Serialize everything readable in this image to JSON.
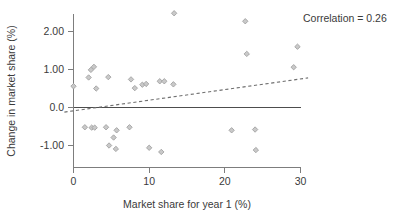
{
  "chart_data": {
    "type": "scatter",
    "title": "",
    "xlabel": "Market share for year 1 (%)",
    "ylabel": "Change in market share (%)",
    "xlim": [
      -1.5,
      31.5
    ],
    "ylim": [
      -1.55,
      2.75
    ],
    "xticks": [
      0,
      10,
      20,
      30
    ],
    "xtick_labels": [
      "0",
      "10",
      "20",
      "30"
    ],
    "yticks": [
      -1.0,
      0.0,
      1.0,
      2.0
    ],
    "ytick_labels": [
      "-1.00",
      "0.0",
      "1.00",
      "2.00"
    ],
    "grid": false,
    "legend": null,
    "annotations": [
      {
        "name": "correlation-annotation",
        "text": "Correlation = 0.26",
        "x_px": 303,
        "y_px": 18
      }
    ],
    "reference_lines": [
      {
        "name": "zero-line",
        "orientation": "horizontal",
        "value": 0.0,
        "style": "solid"
      }
    ],
    "trend_line": {
      "name": "fit-line",
      "style": "dashed",
      "x_start": -1.2,
      "y_start": -0.12,
      "x_end": 31.0,
      "y_end": 0.78
    },
    "points": [
      {
        "x": 0.0,
        "y": 0.56
      },
      {
        "x": 1.5,
        "y": -0.52
      },
      {
        "x": 2.0,
        "y": 0.79
      },
      {
        "x": 2.3,
        "y": 0.99
      },
      {
        "x": 2.7,
        "y": 1.07
      },
      {
        "x": 2.4,
        "y": -0.53
      },
      {
        "x": 2.8,
        "y": -0.53
      },
      {
        "x": 3.0,
        "y": 0.5
      },
      {
        "x": 4.3,
        "y": -0.52
      },
      {
        "x": 4.6,
        "y": 0.8
      },
      {
        "x": 4.7,
        "y": -1.0
      },
      {
        "x": 5.3,
        "y": -0.79
      },
      {
        "x": 5.7,
        "y": -0.6
      },
      {
        "x": 5.6,
        "y": -1.09
      },
      {
        "x": 7.4,
        "y": -0.52
      },
      {
        "x": 7.6,
        "y": 0.74
      },
      {
        "x": 8.1,
        "y": 0.51
      },
      {
        "x": 9.1,
        "y": 0.6
      },
      {
        "x": 9.6,
        "y": 0.62
      },
      {
        "x": 10.0,
        "y": -1.06
      },
      {
        "x": 11.4,
        "y": 0.69
      },
      {
        "x": 11.6,
        "y": -1.17
      },
      {
        "x": 12.0,
        "y": 0.69
      },
      {
        "x": 13.2,
        "y": 0.61
      },
      {
        "x": 13.3,
        "y": 2.48
      },
      {
        "x": 20.9,
        "y": -0.6
      },
      {
        "x": 22.7,
        "y": 2.27
      },
      {
        "x": 22.9,
        "y": 1.41
      },
      {
        "x": 24.0,
        "y": -0.58
      },
      {
        "x": 24.1,
        "y": -1.12
      },
      {
        "x": 29.1,
        "y": 1.06
      },
      {
        "x": 29.6,
        "y": 1.6
      }
    ]
  },
  "colors": {
    "point_fill": "#c9c9c9",
    "point_stroke": "#9a9a9a",
    "axis": "#7d7d7d",
    "text": "#3a3a3a",
    "zero_line": "#4d4d4d",
    "background": "#ffffff"
  }
}
